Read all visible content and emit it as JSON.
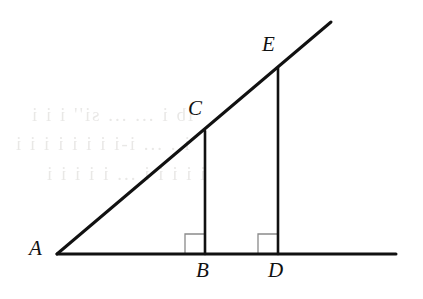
{
  "figure": {
    "kind": "geometry-diagram",
    "background_color": "#ffffff",
    "stroke_color": "#111111",
    "right_angle_color": "#8a8a8a",
    "line_width": 3,
    "right_angle_line_width": 1.3
  },
  "labels": {
    "a": "A",
    "b": "B",
    "c": "C",
    "d": "D",
    "e": "E"
  },
  "label_positions": {
    "a": {
      "x": 29,
      "y": 238
    },
    "b": {
      "x": 196,
      "y": 260
    },
    "c": {
      "x": 188,
      "y": 98
    },
    "d": {
      "x": 268,
      "y": 260
    },
    "e": {
      "x": 262,
      "y": 34
    }
  },
  "points": {
    "A": {
      "x": 57,
      "y": 254
    },
    "B": {
      "x": 205,
      "y": 254
    },
    "C": {
      "x": 205,
      "y": 131
    },
    "D": {
      "x": 278,
      "y": 254
    },
    "E": {
      "x": 278,
      "y": 68
    }
  },
  "segments": [
    {
      "name": "ray-A-through-C-E",
      "x1": 57,
      "y1": 254,
      "x2": 331,
      "y2": 22
    },
    {
      "name": "horizontal-base-line",
      "x1": 57,
      "y1": 254,
      "x2": 396,
      "y2": 254
    },
    {
      "name": "segment-C-B",
      "x1": 205,
      "y1": 131,
      "x2": 205,
      "y2": 254
    },
    {
      "name": "segment-E-D",
      "x1": 278,
      "y1": 68,
      "x2": 278,
      "y2": 254
    }
  ],
  "right_angle_marks": [
    {
      "name": "right-angle-at-B",
      "x": 185,
      "y": 234,
      "size": 20
    },
    {
      "name": "right-angle-at-D",
      "x": 258,
      "y": 234,
      "size": 20
    }
  ],
  "ghost_text": [
    {
      "text": "ib   i  ...  ...  si'' i   i i",
      "x": 30,
      "y": 104
    },
    {
      "text": "i .  ...  i-i i i  i  i i i i",
      "x": 14,
      "y": 133
    },
    {
      "text": "i i i   i i ... i i i i i",
      "x": 45,
      "y": 163
    }
  ]
}
